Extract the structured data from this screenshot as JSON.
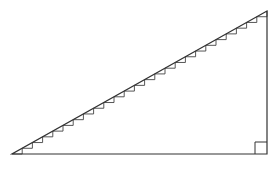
{
  "diagram": {
    "type": "right-triangle-staircase",
    "stroke_color": "#333333",
    "step_color": "#444444",
    "background": "#ffffff",
    "vertices": {
      "bottom_left": [
        12,
        154
      ],
      "bottom_right": [
        267,
        154
      ],
      "top_right": [
        267,
        11
      ]
    },
    "right_angle_marker_size": 12,
    "step_count": 25
  }
}
